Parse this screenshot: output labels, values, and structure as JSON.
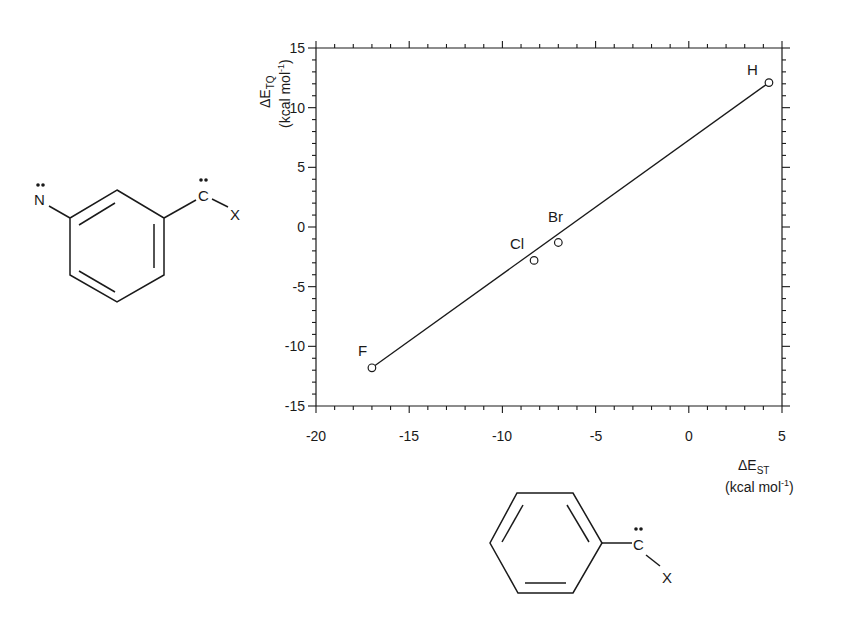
{
  "chart_data": {
    "type": "scatter",
    "title": "",
    "xlabel": "ΔE_ST (kcal mol⁻¹)",
    "ylabel": "ΔE_TQ (kcal mol⁻¹)",
    "xlim": [
      -20,
      5
    ],
    "ylim": [
      -15,
      15
    ],
    "x_ticks": [
      -20,
      -15,
      -10,
      -5,
      0,
      5
    ],
    "y_ticks": [
      -15,
      -10,
      -5,
      0,
      5,
      10,
      15
    ],
    "grid": false,
    "legend": null,
    "points": [
      {
        "label": "F",
        "x": -17.0,
        "y": -11.8
      },
      {
        "label": "Cl",
        "x": -8.3,
        "y": -2.8
      },
      {
        "label": "Br",
        "x": -7.0,
        "y": -1.3
      },
      {
        "label": "H",
        "x": 4.3,
        "y": 12.1
      }
    ],
    "fit_line": {
      "x": [
        -17.0,
        4.3
      ],
      "y": [
        -11.8,
        12.1
      ]
    },
    "annotations": [
      "m-nitrenophenylcarbene structure (N with lone pair, C with lone pair bonded to X) on y-axis side",
      "phenylcarbene structure (C with lone pair bonded to X) on x-axis side"
    ]
  },
  "axes": {
    "x_title_main": "ΔE",
    "x_title_sub": "ST",
    "x_units_pre": "(kcal mol",
    "x_units_sup": "-1",
    "x_units_post": ")",
    "y_title_main": "ΔE",
    "y_title_sub": "TQ",
    "y_units_pre": "(kcal mol",
    "y_units_sup": "-1",
    "y_units_post": ")",
    "x_tick_labels": [
      "-20",
      "-15",
      "-10",
      "-5",
      "0",
      "5"
    ],
    "y_tick_labels": [
      "15",
      "10",
      "5",
      "0",
      "-5",
      "-10",
      "-15"
    ]
  },
  "points": {
    "F": "F",
    "Cl": "Cl",
    "Br": "Br",
    "H": "H"
  },
  "molecules": {
    "nitrene_carbene": {
      "n_atom": "N",
      "c_atom": "C",
      "x_sub": "X"
    },
    "phenyl_carbene": {
      "c_atom": "C",
      "x_sub": "X"
    }
  }
}
